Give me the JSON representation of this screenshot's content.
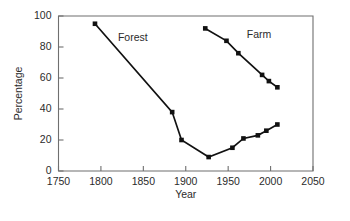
{
  "chart_data": {
    "type": "line",
    "title": "",
    "xlabel": "Year",
    "ylabel": "Percentage",
    "xlim": [
      1750,
      2050
    ],
    "ylim": [
      0,
      100
    ],
    "xticks": [
      1750,
      1800,
      1850,
      1900,
      1950,
      2000,
      2050
    ],
    "yticks": [
      0,
      20,
      40,
      60,
      80,
      100
    ],
    "xtick_labels": [
      "1750",
      "1800",
      "1850",
      "1900",
      "1950",
      "2000",
      "2050"
    ],
    "ytick_labels": [
      "0",
      "20",
      "40",
      "60",
      "80",
      "100"
    ],
    "grid": false,
    "legend": "inline-annotations",
    "series": [
      {
        "name": "Forest",
        "label": "Forest",
        "label_x": 1820,
        "label_y": 84,
        "marker": "square",
        "color": "#111111",
        "points": [
          {
            "x": 1793,
            "y": 95
          },
          {
            "x": 1884,
            "y": 38
          },
          {
            "x": 1895,
            "y": 20
          },
          {
            "x": 1927,
            "y": 9
          },
          {
            "x": 1955,
            "y": 15
          },
          {
            "x": 1968,
            "y": 21
          },
          {
            "x": 1985,
            "y": 23
          },
          {
            "x": 1995,
            "y": 26
          },
          {
            "x": 2008,
            "y": 30
          }
        ]
      },
      {
        "name": "Farm",
        "label": "Farm",
        "label_x": 1972,
        "label_y": 86,
        "marker": "square",
        "color": "#111111",
        "points": [
          {
            "x": 1923,
            "y": 92
          },
          {
            "x": 1948,
            "y": 84
          },
          {
            "x": 1962,
            "y": 76
          },
          {
            "x": 1990,
            "y": 62
          },
          {
            "x": 1998,
            "y": 58
          },
          {
            "x": 2008,
            "y": 54
          }
        ]
      }
    ]
  }
}
